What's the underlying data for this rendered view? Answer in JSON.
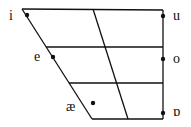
{
  "diagram": {
    "type": "vowel-chart",
    "line_color": "#111111",
    "vowels": [
      {
        "symbol": "i",
        "position": "close-front"
      },
      {
        "symbol": "e",
        "position": "close-mid-front"
      },
      {
        "symbol": "æ",
        "position": "near-open-front"
      },
      {
        "symbol": "u",
        "position": "close-back"
      },
      {
        "symbol": "o",
        "position": "close-mid-back"
      },
      {
        "symbol": "ɒ",
        "position": "open-back"
      }
    ]
  }
}
